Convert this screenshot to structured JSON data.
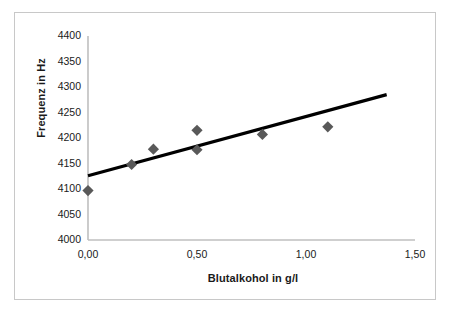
{
  "chart_data": {
    "type": "scatter",
    "title": "",
    "xlabel": "Blutalkohol in g/l",
    "ylabel": "Frequenz in Hz",
    "xlim": [
      0.0,
      1.5
    ],
    "ylim": [
      4000,
      4400
    ],
    "x_ticks": [
      "0,00",
      "0,50",
      "1,00",
      "1,50"
    ],
    "x_tick_values": [
      0.0,
      0.5,
      1.0,
      1.5
    ],
    "y_ticks": [
      "4000",
      "4050",
      "4100",
      "4150",
      "4200",
      "4250",
      "4300",
      "4350",
      "4400"
    ],
    "y_tick_values": [
      4000,
      4050,
      4100,
      4150,
      4200,
      4250,
      4300,
      4350,
      4400
    ],
    "grid": false,
    "legend": "none",
    "marker": "diamond",
    "marker_color": "#595959",
    "points": [
      {
        "x": 0.0,
        "y": 4097
      },
      {
        "x": 0.2,
        "y": 4148
      },
      {
        "x": 0.3,
        "y": 4178
      },
      {
        "x": 0.5,
        "y": 4215
      },
      {
        "x": 0.5,
        "y": 4177
      },
      {
        "x": 0.8,
        "y": 4207
      },
      {
        "x": 1.1,
        "y": 4222
      }
    ],
    "series": [
      {
        "name": "Messwerte",
        "x": [
          0.0,
          0.2,
          0.3,
          0.5,
          0.5,
          0.8,
          1.1
        ],
        "values": [
          4097,
          4148,
          4178,
          4215,
          4177,
          4207,
          4222
        ]
      }
    ],
    "trendline": {
      "type": "linear",
      "color": "#000000",
      "x_start": 0.0,
      "y_start": 4126,
      "x_end": 1.37,
      "y_end": 4285
    }
  },
  "axes": {
    "y_axis_color": "#bfbfbf",
    "x_axis_color": "#bfbfbf",
    "border_color": "#c8c8c8",
    "background": "#ffffff"
  }
}
